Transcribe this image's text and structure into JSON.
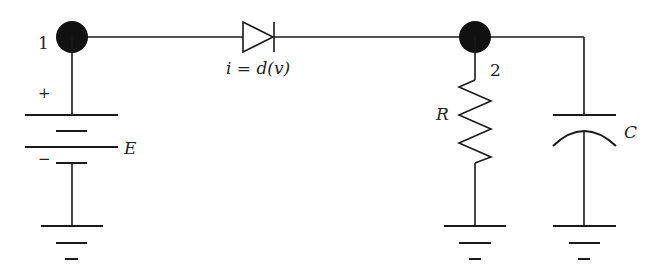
{
  "diagram": {
    "type": "electrical-circuit",
    "labels": {
      "node1": "1",
      "node2": "2",
      "plus": "+",
      "minus": "−",
      "source": "E",
      "diode_relation": "i = d(v)",
      "resistor": "R",
      "capacitor": "C"
    },
    "components": [
      {
        "id": "E",
        "kind": "battery",
        "label": "E"
      },
      {
        "id": "D",
        "kind": "diode",
        "label": "i = d(v)"
      },
      {
        "id": "R",
        "kind": "resistor",
        "label": "R"
      },
      {
        "id": "C",
        "kind": "capacitor",
        "label": "C"
      }
    ],
    "nodes": [
      {
        "id": "1",
        "label": "1"
      },
      {
        "id": "2",
        "label": "2"
      }
    ],
    "colors": {
      "line": "#1a1a1a",
      "node": "#111111",
      "background": "#ffffff"
    }
  }
}
